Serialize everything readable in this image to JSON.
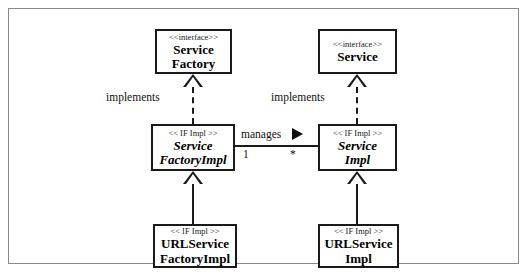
{
  "diagram": {
    "type": "uml-class-diagram",
    "frame": {
      "border_color": "#8a8a8a",
      "background": "#ffffff"
    },
    "line_color": "#1a1a1a",
    "classes": [
      {
        "id": "service-factory",
        "stereotype": "<<interface>>",
        "name_lines": [
          "Service",
          "Factory"
        ],
        "name_line1": "Service",
        "name_line2": "Factory",
        "abstract": false,
        "row": "top",
        "column": "left"
      },
      {
        "id": "service",
        "stereotype": "<<interface>>",
        "name_lines": [
          "Service"
        ],
        "name_line1": "Service",
        "name_line2": "",
        "abstract": false,
        "row": "top",
        "column": "right"
      },
      {
        "id": "service-factory-impl",
        "stereotype": "<< IF Impl >>",
        "name_lines": [
          "Service",
          "FactoryImpl"
        ],
        "name_line1": "Service",
        "name_line2": "FactoryImpl",
        "abstract": true,
        "row": "middle",
        "column": "left"
      },
      {
        "id": "service-impl",
        "stereotype": "<< IF Impl >>",
        "name_lines": [
          "Service",
          "Impl"
        ],
        "name_line1": "Service",
        "name_line2": "Impl",
        "abstract": true,
        "row": "middle",
        "column": "right"
      },
      {
        "id": "url-service-factory-impl",
        "stereotype": "<< IF Impl >>",
        "name_lines": [
          "URLService",
          "FactoryImpl"
        ],
        "name_line1": "URLService",
        "name_line2": "FactoryImpl",
        "abstract": false,
        "row": "bottom",
        "column": "left"
      },
      {
        "id": "url-service-impl",
        "stereotype": "<< IF Impl >>",
        "name_lines": [
          "URLService",
          "Impl"
        ],
        "name_line1": "URLService",
        "name_line2": "Impl",
        "abstract": false,
        "row": "bottom",
        "column": "right"
      }
    ],
    "relationships": [
      {
        "id": "realization-left",
        "kind": "realization",
        "line_style": "dashed",
        "arrowhead": "hollow-triangle",
        "label": "implements",
        "from": "service-factory-impl",
        "to": "service-factory"
      },
      {
        "id": "realization-right",
        "kind": "realization",
        "line_style": "dashed",
        "arrowhead": "hollow-triangle",
        "label": "implements",
        "from": "service-impl",
        "to": "service"
      },
      {
        "id": "generalization-left",
        "kind": "generalization",
        "line_style": "solid",
        "arrowhead": "hollow-triangle",
        "label": "",
        "from": "url-service-factory-impl",
        "to": "service-factory-impl"
      },
      {
        "id": "generalization-right",
        "kind": "generalization",
        "line_style": "solid",
        "arrowhead": "hollow-triangle",
        "label": "",
        "from": "url-service-impl",
        "to": "service-impl"
      },
      {
        "id": "association-manages",
        "kind": "association",
        "line_style": "solid",
        "arrowhead": "filled-triangle",
        "label": "manages",
        "source_multiplicity": "1",
        "target_multiplicity": "*",
        "from": "service-factory-impl",
        "to": "service-impl"
      }
    ]
  }
}
